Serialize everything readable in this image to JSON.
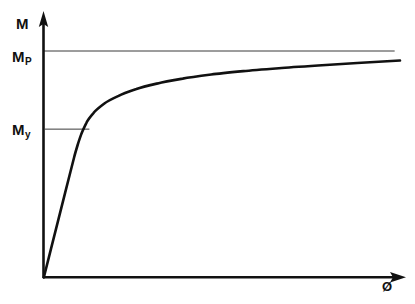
{
  "figure": {
    "kind": "moment-curvature-diagram",
    "background_color": "#ffffff",
    "ink_color": "#111111",
    "thin_line_color": "#3a3a3a"
  },
  "labels": {
    "y_axis": {
      "base": "M",
      "sub": ""
    },
    "plastic_moment": {
      "base": "M",
      "sub": "P"
    },
    "yield_moment": {
      "base": "M",
      "sub": "y"
    },
    "x_axis": {
      "base": "Ø",
      "sub": ""
    }
  },
  "chart_data": {
    "type": "line",
    "title": "",
    "xlabel": "Ø",
    "ylabel": "M",
    "grid": false,
    "legend_position": "none",
    "xlim": [
      0,
      1
    ],
    "ylim": [
      0,
      1.06
    ],
    "axis_arrows": {
      "x": true,
      "y": true
    },
    "series": [
      {
        "name": "moment-curvature-curve",
        "stroke_width": 2.6,
        "x": [
          0.0,
          0.02,
          0.04,
          0.06,
          0.075,
          0.085,
          0.095,
          0.105,
          0.12,
          0.14,
          0.17,
          0.21,
          0.26,
          0.32,
          0.39,
          0.47,
          0.56,
          0.66,
          0.77,
          0.88,
          1.0
        ],
        "y": [
          0.0,
          0.125,
          0.25,
          0.375,
          0.468,
          0.53,
          0.585,
          0.632,
          0.684,
          0.727,
          0.768,
          0.802,
          0.832,
          0.857,
          0.878,
          0.896,
          0.911,
          0.924,
          0.936,
          0.947,
          0.958
        ]
      }
    ],
    "reference_lines": [
      {
        "name": "plastic-moment-asymptote",
        "orientation": "horizontal",
        "value": 1.0,
        "label": "M_P",
        "x_from": 0.0,
        "x_to": 0.985,
        "stroke_width": 0.9
      },
      {
        "name": "yield-moment-tick",
        "orientation": "horizontal",
        "value": 0.655,
        "label": "M_y",
        "x_from": 0.003,
        "x_to": 0.128,
        "stroke_width": 0.9
      }
    ],
    "annotations": [
      {
        "name": "origin",
        "x": 0.0,
        "y": 0.0,
        "text": ""
      },
      {
        "name": "knee",
        "x": 0.1,
        "y": 0.62,
        "text": ""
      }
    ]
  }
}
